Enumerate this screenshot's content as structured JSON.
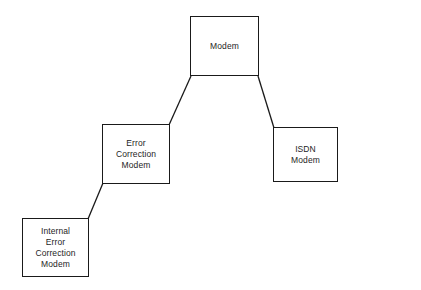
{
  "diagram": {
    "background_color": "#ffffff",
    "line_color": "#1a1a1a",
    "text_color": "#1e1e1e",
    "nodes": [
      {
        "id": "modem",
        "label": "Modem",
        "x": 190,
        "y": 16,
        "w": 69,
        "h": 60
      },
      {
        "id": "error-correction-modem",
        "label": "Error\nCorrection\nModem",
        "x": 102,
        "y": 124,
        "w": 68,
        "h": 60
      },
      {
        "id": "isdn-modem",
        "label": "ISDN\nModem",
        "x": 273,
        "y": 127,
        "w": 65,
        "h": 55
      },
      {
        "id": "internal-error-correction-modem",
        "label": "Internal\nError\nCorrection\nModem",
        "x": 22,
        "y": 218,
        "w": 67,
        "h": 59
      }
    ],
    "edges": [
      {
        "id": "modem-to-error-correction",
        "from": "modem",
        "to": "error-correction-modem",
        "x1": 191,
        "y1": 76,
        "x2": 169,
        "y2": 125
      },
      {
        "id": "modem-to-isdn",
        "from": "modem",
        "to": "isdn-modem",
        "x1": 258,
        "y1": 76,
        "x2": 274,
        "y2": 128
      },
      {
        "id": "error-correction-to-internal",
        "from": "error-correction-modem",
        "to": "internal-error-correction-modem",
        "x1": 103,
        "y1": 183,
        "x2": 88,
        "y2": 219
      }
    ]
  }
}
